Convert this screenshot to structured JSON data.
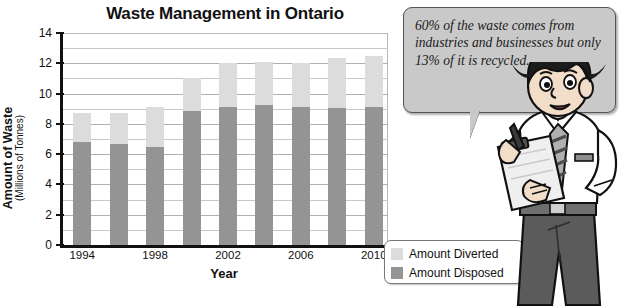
{
  "chart_data": {
    "type": "bar",
    "subtype": "stacked",
    "title": "Waste Management in Ontario",
    "xlabel": "Year",
    "ylabel": "Amount of Waste",
    "ylabel_sub": "(Millions of Tonnes)",
    "categories": [
      1994,
      1996,
      1998,
      2000,
      2002,
      2004,
      2006,
      2008,
      2010
    ],
    "tick_labels": [
      "1994",
      "",
      "1998",
      "",
      "2002",
      "",
      "2006",
      "",
      "2010"
    ],
    "series": [
      {
        "name": "Amount Disposed",
        "color": "#949494",
        "values": [
          6.8,
          6.7,
          6.5,
          8.85,
          9.1,
          9.25,
          9.1,
          9.05,
          9.1
        ]
      },
      {
        "name": "Amount Diverted",
        "color": "#dcdcdc",
        "values": [
          1.95,
          2.05,
          2.6,
          2.15,
          2.9,
          2.85,
          2.9,
          3.3,
          3.35
        ]
      }
    ],
    "totals": [
      8.75,
      8.75,
      9.1,
      11.0,
      12.0,
      12.1,
      12.0,
      12.35,
      12.45
    ],
    "ylim": [
      0,
      14
    ],
    "ytick_values": [
      0,
      2,
      4,
      6,
      8,
      10,
      12,
      14
    ],
    "ytick_labels": [
      "0",
      "2",
      "4",
      "6",
      "8",
      "10",
      "12",
      "14"
    ],
    "gridline_step": 1,
    "grid": true,
    "legend_position": "bottom-right",
    "legend_entries": [
      {
        "label": "Amount Diverted",
        "color": "#dcdcdc"
      },
      {
        "label": "Amount Disposed",
        "color": "#949494"
      }
    ]
  },
  "speech_bubble": {
    "text": "60% of the waste comes from industries and businesses but only 13% of it is recycled."
  },
  "illustration": {
    "character": "man-with-clipboard",
    "details": "cartoon man, dark hair, white dress shirt, striped tie, holding clipboard and pen"
  }
}
